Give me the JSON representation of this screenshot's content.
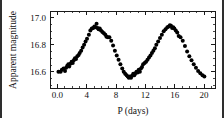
{
  "chart_data": {
    "type": "scatter",
    "title": "",
    "xlabel": "P (days)",
    "ylabel": "Apparent magnitude",
    "xlim": [
      -1.0,
      21.5
    ],
    "ylim": [
      17.05,
      16.48
    ],
    "y_inverted": true,
    "grid": false,
    "legend": "none",
    "xticks": [
      0.0,
      4,
      8,
      12,
      16,
      20
    ],
    "xticklabels": [
      "0.0",
      "4",
      "8",
      "12",
      "16",
      "20"
    ],
    "yticks": [
      16.6,
      16.8,
      17.0
    ],
    "yticklabels": [
      "16.6",
      "16.8",
      "17.0"
    ],
    "x_minor_tick_step": 1,
    "y_minor_tick_step": 0.05,
    "marker": "filled-circle",
    "marker_color": "#000000",
    "marker_size": 2.0,
    "series": [
      {
        "name": "Cepheid light curve",
        "x": [
          0.15,
          0.45,
          0.62,
          0.85,
          1.05,
          1.2,
          1.35,
          1.5,
          1.62,
          1.78,
          1.95,
          2.1,
          2.25,
          2.4,
          2.55,
          2.72,
          2.9,
          3.05,
          3.25,
          3.45,
          3.65,
          3.85,
          4.05,
          4.3,
          4.5,
          4.7,
          4.9,
          5.05,
          5.2,
          5.35,
          5.5,
          5.62,
          5.78,
          5.95,
          6.15,
          6.35,
          6.55,
          6.7,
          6.9,
          7.1,
          7.35,
          7.6,
          7.85,
          8.1,
          8.35,
          8.6,
          8.85,
          9.05,
          9.25,
          9.45,
          9.6,
          9.75,
          9.9,
          10.05,
          10.2,
          10.35,
          10.5,
          10.65,
          10.8,
          10.95,
          11.1,
          11.25,
          11.4,
          11.55,
          11.7,
          11.9,
          12.1,
          12.3,
          12.5,
          12.7,
          12.9,
          13.1,
          13.3,
          13.5,
          13.75,
          14.0,
          14.25,
          14.5,
          14.75,
          15.0,
          15.2,
          15.35,
          15.5,
          15.65,
          15.8,
          15.95,
          16.15,
          16.35,
          16.55,
          16.8,
          17.1,
          17.4,
          17.7,
          18.0,
          18.3,
          18.6,
          18.9,
          19.2,
          19.5,
          19.8,
          20.05
        ],
        "y": [
          16.6,
          16.6,
          16.615,
          16.625,
          16.605,
          16.63,
          16.645,
          16.655,
          16.64,
          16.66,
          16.675,
          16.665,
          16.685,
          16.7,
          16.695,
          16.715,
          16.725,
          16.74,
          16.755,
          16.78,
          16.8,
          16.825,
          16.845,
          16.875,
          16.905,
          16.92,
          16.925,
          16.935,
          16.93,
          16.955,
          16.925,
          16.915,
          16.92,
          16.905,
          16.895,
          16.885,
          16.875,
          16.86,
          16.855,
          16.855,
          16.83,
          16.795,
          16.755,
          16.72,
          16.69,
          16.655,
          16.625,
          16.6,
          16.585,
          16.575,
          16.565,
          16.555,
          16.565,
          16.555,
          16.57,
          16.585,
          16.575,
          16.59,
          16.6,
          16.595,
          16.615,
          16.6,
          16.625,
          16.635,
          16.655,
          16.665,
          16.675,
          16.69,
          16.705,
          16.72,
          16.74,
          16.755,
          16.775,
          16.8,
          16.825,
          16.85,
          16.875,
          16.9,
          16.915,
          16.93,
          16.935,
          16.945,
          16.94,
          16.925,
          16.93,
          16.92,
          16.905,
          16.89,
          16.865,
          16.855,
          16.83,
          16.79,
          16.75,
          16.715,
          16.685,
          16.655,
          16.63,
          16.605,
          16.59,
          16.575,
          16.565
        ]
      }
    ]
  }
}
